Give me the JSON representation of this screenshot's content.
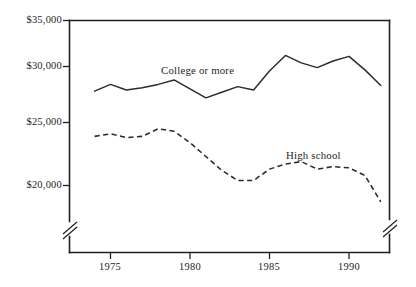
{
  "chart_data": {
    "type": "line",
    "title": "",
    "subtitle": "",
    "xlabel": "",
    "ylabel": "",
    "xlim": [
      1974,
      1992
    ],
    "ylim": [
      18000,
      35000
    ],
    "ytick_values": [
      20000,
      25000,
      30000,
      35000
    ],
    "ytick_labels": [
      "$20,000",
      "$25,000",
      "$30,000",
      "$35,000"
    ],
    "xtick_values": [
      1975,
      1980,
      1985,
      1990
    ],
    "xtick_labels": [
      "1975",
      "1980",
      "1985",
      "1990"
    ],
    "grid": false,
    "legend_position": "inline-annotation",
    "y_axis_break": true,
    "x": [
      1974,
      1975,
      1976,
      1977,
      1978,
      1979,
      1980,
      1981,
      1982,
      1983,
      1984,
      1985,
      1986,
      1987,
      1988,
      1989,
      1990,
      1991,
      1992
    ],
    "series": [
      {
        "name": "College or more",
        "style": "solid",
        "color": "#2d2a2b",
        "values": [
          27800,
          28400,
          27900,
          28100,
          28400,
          28800,
          28000,
          27200,
          27700,
          28200,
          27900,
          29600,
          31200,
          30400,
          29900,
          30600,
          31100,
          29700,
          28300
        ]
      },
      {
        "name": "High school",
        "style": "dashed",
        "color": "#2d2a2b",
        "values": [
          23900,
          24100,
          23800,
          23900,
          24500,
          24300,
          23400,
          22300,
          21200,
          20400,
          20400,
          21300,
          21700,
          21900,
          21300,
          21500,
          21400,
          20800,
          18700
        ]
      }
    ],
    "annotations": [
      {
        "text": "College or more",
        "x": 1980.0,
        "y": 32000
      },
      {
        "text": "High school",
        "x": 1987.6,
        "y": 23600
      }
    ]
  }
}
